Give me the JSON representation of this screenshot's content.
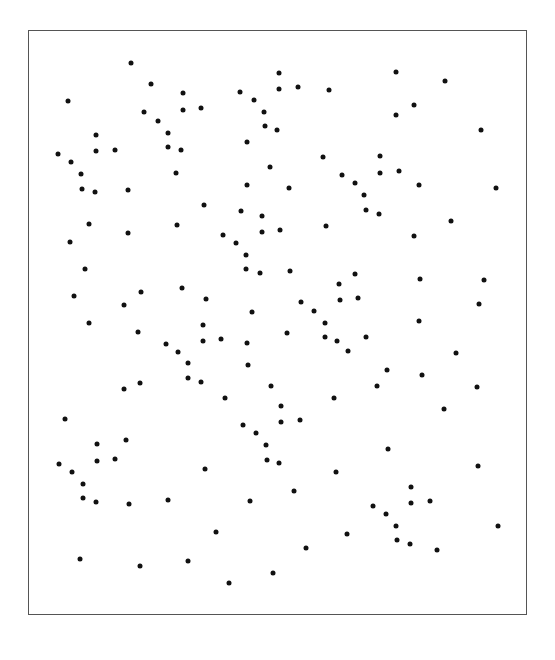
{
  "chart_data": {
    "type": "scatter",
    "title": "",
    "xlabel": "",
    "ylabel": "",
    "grid": false,
    "legend": null,
    "axes_visible": false,
    "coordinate_space": "pixel (image coords, origin top-left)",
    "frame": {
      "x0": 28,
      "y0": 30,
      "x1": 527,
      "y1": 615
    },
    "marker_color": "#111111",
    "frame_color": "#555555",
    "points": [
      [
        131,
        63
      ],
      [
        151,
        84
      ],
      [
        183,
        93
      ],
      [
        183,
        110
      ],
      [
        68,
        101
      ],
      [
        144,
        112
      ],
      [
        158,
        121
      ],
      [
        168,
        133
      ],
      [
        168,
        147
      ],
      [
        181,
        150
      ],
      [
        96,
        135
      ],
      [
        96,
        151
      ],
      [
        115,
        150
      ],
      [
        58,
        154
      ],
      [
        71,
        162
      ],
      [
        81,
        174
      ],
      [
        82,
        189
      ],
      [
        95,
        192
      ],
      [
        128,
        190
      ],
      [
        176,
        173
      ],
      [
        279,
        73
      ],
      [
        240,
        92
      ],
      [
        279,
        89
      ],
      [
        298,
        87
      ],
      [
        329,
        90
      ],
      [
        201,
        108
      ],
      [
        254,
        100
      ],
      [
        264,
        112
      ],
      [
        265,
        126
      ],
      [
        277,
        130
      ],
      [
        247,
        142
      ],
      [
        323,
        157
      ],
      [
        270,
        167
      ],
      [
        247,
        185
      ],
      [
        289,
        188
      ],
      [
        342,
        175
      ],
      [
        355,
        183
      ],
      [
        364,
        195
      ],
      [
        396,
        72
      ],
      [
        445,
        81
      ],
      [
        414,
        105
      ],
      [
        396,
        115
      ],
      [
        481,
        130
      ],
      [
        380,
        156
      ],
      [
        380,
        173
      ],
      [
        399,
        171
      ],
      [
        419,
        185
      ],
      [
        496,
        188
      ],
      [
        89,
        224
      ],
      [
        128,
        233
      ],
      [
        177,
        225
      ],
      [
        70,
        242
      ],
      [
        85,
        269
      ],
      [
        182,
        288
      ],
      [
        74,
        296
      ],
      [
        141,
        292
      ],
      [
        124,
        305
      ],
      [
        89,
        323
      ],
      [
        138,
        332
      ],
      [
        166,
        344
      ],
      [
        178,
        352
      ],
      [
        188,
        363
      ],
      [
        204,
        205
      ],
      [
        241,
        211
      ],
      [
        262,
        216
      ],
      [
        223,
        235
      ],
      [
        262,
        232
      ],
      [
        280,
        230
      ],
      [
        326,
        226
      ],
      [
        236,
        243
      ],
      [
        246,
        255
      ],
      [
        246,
        269
      ],
      [
        260,
        273
      ],
      [
        290,
        271
      ],
      [
        355,
        274
      ],
      [
        339,
        284
      ],
      [
        340,
        300
      ],
      [
        358,
        298
      ],
      [
        206,
        299
      ],
      [
        252,
        312
      ],
      [
        301,
        302
      ],
      [
        314,
        311
      ],
      [
        203,
        325
      ],
      [
        221,
        339
      ],
      [
        203,
        341
      ],
      [
        247,
        343
      ],
      [
        287,
        333
      ],
      [
        325,
        323
      ],
      [
        325,
        337
      ],
      [
        337,
        341
      ],
      [
        348,
        351
      ],
      [
        248,
        365
      ],
      [
        366,
        210
      ],
      [
        379,
        214
      ],
      [
        451,
        221
      ],
      [
        414,
        236
      ],
      [
        420,
        279
      ],
      [
        484,
        280
      ],
      [
        479,
        304
      ],
      [
        419,
        321
      ],
      [
        366,
        337
      ],
      [
        456,
        353
      ],
      [
        188,
        378
      ],
      [
        124,
        389
      ],
      [
        140,
        383
      ],
      [
        65,
        419
      ],
      [
        97,
        444
      ],
      [
        126,
        440
      ],
      [
        97,
        461
      ],
      [
        115,
        459
      ],
      [
        59,
        464
      ],
      [
        72,
        472
      ],
      [
        83,
        484
      ],
      [
        83,
        498
      ],
      [
        96,
        502
      ],
      [
        129,
        504
      ],
      [
        168,
        500
      ],
      [
        201,
        382
      ],
      [
        271,
        386
      ],
      [
        225,
        398
      ],
      [
        334,
        398
      ],
      [
        281,
        406
      ],
      [
        281,
        422
      ],
      [
        300,
        420
      ],
      [
        243,
        425
      ],
      [
        256,
        433
      ],
      [
        266,
        445
      ],
      [
        267,
        460
      ],
      [
        279,
        463
      ],
      [
        205,
        469
      ],
      [
        336,
        472
      ],
      [
        294,
        491
      ],
      [
        250,
        501
      ],
      [
        387,
        370
      ],
      [
        422,
        375
      ],
      [
        377,
        386
      ],
      [
        477,
        387
      ],
      [
        444,
        409
      ],
      [
        388,
        449
      ],
      [
        478,
        466
      ],
      [
        411,
        487
      ],
      [
        411,
        503
      ],
      [
        430,
        501
      ],
      [
        373,
        506
      ],
      [
        386,
        514
      ],
      [
        396,
        526
      ],
      [
        498,
        526
      ],
      [
        397,
        540
      ],
      [
        410,
        544
      ],
      [
        437,
        550
      ],
      [
        347,
        534
      ],
      [
        306,
        548
      ],
      [
        80,
        559
      ],
      [
        140,
        566
      ],
      [
        188,
        561
      ],
      [
        216,
        532
      ],
      [
        229,
        583
      ],
      [
        273,
        573
      ]
    ]
  }
}
